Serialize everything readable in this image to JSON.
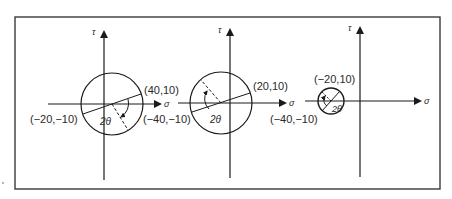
{
  "figure": {
    "frame_color": "#3a3a3a",
    "line_color": "#2a2a2a"
  },
  "axes": {
    "x_label": "σ",
    "y_label": "τ"
  },
  "panels": [
    {
      "id": "panel-1",
      "point_a": "(40,10)",
      "point_b": "(−20,−10)",
      "angle_label": "2θ"
    },
    {
      "id": "panel-2",
      "point_a": "(20,10)",
      "point_b": "(−40,−10)",
      "angle_label": "2θ"
    },
    {
      "id": "panel-3",
      "point_a": "(−20,10)",
      "point_b": "(−40,−10)",
      "angle_label": "2θ"
    }
  ]
}
